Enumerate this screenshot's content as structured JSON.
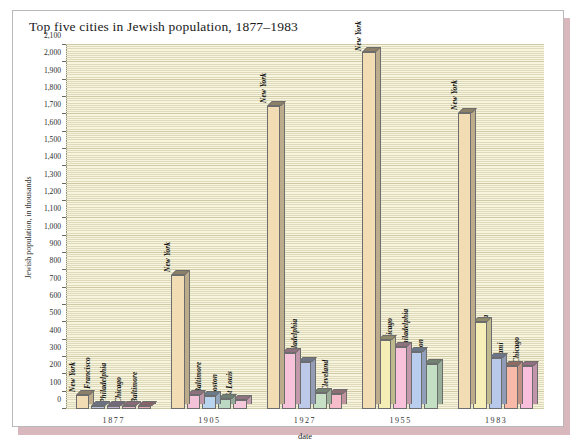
{
  "title": "Top five cities in Jewish population, 1877–1983",
  "axes": {
    "ylabel": "Jewish population, in thousands",
    "xlabel": "date",
    "yticks": [
      "0",
      "100",
      "200",
      "300",
      "400",
      "500",
      "600",
      "700",
      "800",
      "900",
      "1,000",
      "1,100",
      "1,200",
      "1,300",
      "1,400",
      "1,500",
      "1,600",
      "1,700",
      "1,800",
      "1,900",
      "2,000",
      "2,100"
    ]
  },
  "chart_data": {
    "type": "bar",
    "title": "Top five cities in Jewish population, 1877–1983",
    "xlabel": "date",
    "ylabel": "Jewish population, in thousands",
    "ylim": [
      0,
      2100
    ],
    "ytick_step": 100,
    "grid": true,
    "legend": "none",
    "style": "3d-grouped-bars",
    "categories": [
      "1877",
      "1905",
      "1927",
      "1955",
      "1983"
    ],
    "groups": [
      {
        "date": "1877",
        "bars": [
          {
            "city": "New York",
            "value": 80,
            "color": "#f2dcb4"
          },
          {
            "city": "San Francisco",
            "value": 16,
            "color": "#b9c4e0"
          },
          {
            "city": "Philadelphia",
            "value": 12,
            "color": "#c7b4d6"
          },
          {
            "city": "Chicago",
            "value": 10,
            "color": "#e8b7cc"
          },
          {
            "city": "Baltimore",
            "value": 10,
            "color": "#e8a9b4"
          }
        ]
      },
      {
        "date": "1905",
        "bars": [
          {
            "city": "New York",
            "value": 773,
            "color": "#f2dcb4"
          },
          {
            "city": "Chicago",
            "value": 80,
            "color": "#f4c2d8"
          },
          {
            "city": "Baltimore",
            "value": 75,
            "color": "#b9d4ee"
          },
          {
            "city": "Boston",
            "value": 60,
            "color": "#bcd9c4"
          },
          {
            "city": "St Louis",
            "value": 50,
            "color": "#f6c8dc"
          }
        ]
      },
      {
        "date": "1927",
        "bars": [
          {
            "city": "New York",
            "value": 1750,
            "color": "#f2dcb4"
          },
          {
            "city": "Chicago",
            "value": 325,
            "color": "#f6c3da"
          },
          {
            "city": "Philadelphia",
            "value": 270,
            "color": "#bcc9e8"
          },
          {
            "city": "Boston",
            "value": 90,
            "color": "#c7e0c6"
          },
          {
            "city": "Cleveland",
            "value": 85,
            "color": "#f7bcc9"
          }
        ]
      },
      {
        "date": "1955",
        "bars": [
          {
            "city": "New York",
            "value": 2060,
            "color": "#f2dcb4"
          },
          {
            "city": "Los Angeles",
            "value": 400,
            "color": "#f5edb6"
          },
          {
            "city": "Chicago",
            "value": 360,
            "color": "#f8c2da"
          },
          {
            "city": "Philadelphia",
            "value": 330,
            "color": "#b9cdee"
          },
          {
            "city": "Boston",
            "value": 260,
            "color": "#c3e0c4"
          }
        ]
      },
      {
        "date": "1983",
        "bars": [
          {
            "city": "New York",
            "value": 1710,
            "color": "#f2dcb4"
          },
          {
            "city": "Los Angeles",
            "value": 500,
            "color": "#f6efb8"
          },
          {
            "city": "Philadelphia",
            "value": 295,
            "color": "#b8c8ea"
          },
          {
            "city": "Miami",
            "value": 250,
            "color": "#f9b9a8"
          },
          {
            "city": "Chicago",
            "value": 250,
            "color": "#f9bedb"
          }
        ]
      }
    ]
  }
}
